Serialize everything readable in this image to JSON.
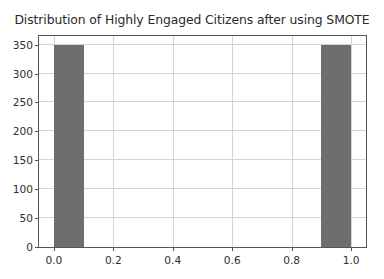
{
  "chart_data": {
    "type": "bar",
    "title": "Distribution of Highly Engaged Citizens after using SMOTE",
    "xlabel": "",
    "ylabel": "",
    "xlim": [
      -0.05,
      1.05
    ],
    "ylim": [
      0,
      365
    ],
    "grid": true,
    "legend": null,
    "bar_color": "#6e6e6e",
    "categories": [
      "0.0",
      "1.0"
    ],
    "values": [
      350,
      350
    ],
    "bars": [
      {
        "label": "0.0",
        "x_start": 0.0,
        "x_end": 0.1,
        "value": 350
      },
      {
        "label": "1.0",
        "x_start": 0.9,
        "x_end": 1.0,
        "value": 350
      }
    ],
    "xticks": [
      {
        "value": 0.0,
        "label": "0.0"
      },
      {
        "value": 0.2,
        "label": "0.2"
      },
      {
        "value": 0.4,
        "label": "0.4"
      },
      {
        "value": 0.6,
        "label": "0.6"
      },
      {
        "value": 0.8,
        "label": "0.8"
      },
      {
        "value": 1.0,
        "label": "1.0"
      }
    ],
    "yticks": [
      {
        "value": 0,
        "label": "0"
      },
      {
        "value": 50,
        "label": "50"
      },
      {
        "value": 100,
        "label": "100"
      },
      {
        "value": 150,
        "label": "150"
      },
      {
        "value": 200,
        "label": "200"
      },
      {
        "value": 250,
        "label": "250"
      },
      {
        "value": 300,
        "label": "300"
      },
      {
        "value": 350,
        "label": "350"
      }
    ]
  },
  "colors": {
    "bar": "#6e6e6e",
    "grid": "#d4d4d4",
    "axis": "#555555",
    "text": "#2a2a2a",
    "background": "#ffffff"
  }
}
